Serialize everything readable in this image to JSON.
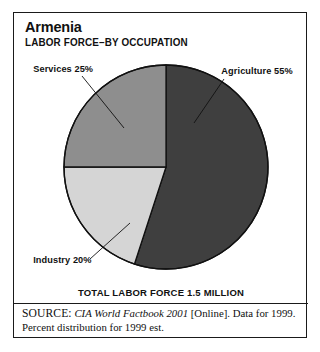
{
  "figure": {
    "title": "Armenia",
    "subtitle": "LABOR FORCE–BY OCCUPATION",
    "total_caption": "TOTAL LABOR FORCE 1.5 MILLION"
  },
  "source": {
    "label": "SOURCE:",
    "title": "CIA World Factbook 2001",
    "rest": "[Online]. Data for 1999. Percent distribution for 1999 est."
  },
  "chart_data": {
    "type": "pie",
    "title": "Armenia",
    "subtitle": "LABOR FORCE–BY OCCUPATION",
    "unit": "percent",
    "total_label": "TOTAL LABOR FORCE 1.5 MILLION",
    "total_value": 1.5,
    "total_units": "million",
    "start_angle_deg": 0,
    "direction": "clockwise",
    "legend": "none",
    "categories": [
      "Agriculture",
      "Industry",
      "Services"
    ],
    "values": [
      55,
      20,
      25
    ],
    "slices": [
      {
        "name": "Agriculture",
        "value": 55,
        "label": "Agriculture 55%",
        "color": "#3f3f3f",
        "label_x": 216,
        "label_y": 61,
        "label_anchor": "start",
        "leader": [
          210,
          66,
          180,
          110
        ]
      },
      {
        "name": "Industry",
        "value": 20,
        "label": "Industry 20%",
        "color": "#d5d5d5",
        "label_x": 20,
        "label_y": 250,
        "label_anchor": "start",
        "leader": [
          76,
          246,
          116,
          210
        ]
      },
      {
        "name": "Services",
        "value": 25,
        "label": "Services 25%",
        "color": "#8e8e8e",
        "label_x": 20,
        "label_y": 59,
        "label_anchor": "start",
        "leader": [
          68,
          63,
          110,
          115
        ]
      }
    ],
    "geometry": {
      "cx": 152,
      "cy": 154,
      "r": 102
    },
    "stroke_color": "#111111"
  }
}
